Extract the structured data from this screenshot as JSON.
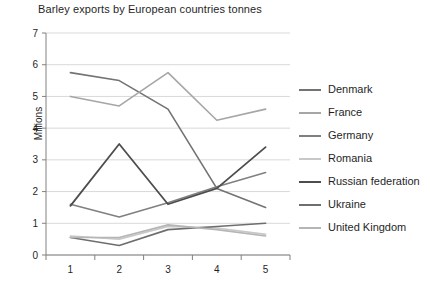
{
  "chart_data": {
    "type": "line",
    "title": "Barley exports by European countries tonnes",
    "xlabel": "",
    "ylabel": "Millions",
    "x": [
      1,
      2,
      3,
      4,
      5
    ],
    "categories": [
      "1",
      "2",
      "3",
      "4",
      "5"
    ],
    "xtick_labels": [
      "1",
      "2",
      "3",
      "4",
      "5"
    ],
    "ytick_labels": [
      "0",
      "1",
      "2",
      "3",
      "4",
      "5",
      "6",
      "7"
    ],
    "yticks": [
      0,
      1,
      2,
      3,
      4,
      5,
      6,
      7
    ],
    "ylim": [
      0,
      7
    ],
    "grid": "horizontal",
    "legend_position": "right",
    "series": [
      {
        "name": "Denmark",
        "color": "#737373",
        "width": 1.6,
        "values": [
          5.75,
          5.5,
          4.6,
          2.1,
          1.5
        ]
      },
      {
        "name": "France",
        "color": "#a6a6a6",
        "width": 1.6,
        "values": [
          5.0,
          4.7,
          5.75,
          4.25,
          4.6
        ]
      },
      {
        "name": "Germany",
        "color": "#808080",
        "width": 1.6,
        "values": [
          1.6,
          1.2,
          1.65,
          2.15,
          2.6
        ]
      },
      {
        "name": "Romania",
        "color": "#c8c8c8",
        "width": 1.6,
        "values": [
          0.6,
          0.5,
          0.9,
          0.85,
          0.65
        ]
      },
      {
        "name": "Russian federation",
        "color": "#4d4d4d",
        "width": 1.8,
        "values": [
          1.55,
          3.5,
          1.6,
          2.1,
          3.4
        ]
      },
      {
        "name": "Ukraine",
        "color": "#6e6e6e",
        "width": 1.6,
        "values": [
          0.55,
          0.3,
          0.8,
          0.9,
          1.0
        ]
      },
      {
        "name": "United Kingdom",
        "color": "#b5b5b5",
        "width": 1.6,
        "values": [
          0.55,
          0.55,
          0.95,
          0.8,
          0.6
        ]
      }
    ]
  },
  "axes": {
    "axis_color": "#808080",
    "grid_color": "#d9d9d9"
  }
}
